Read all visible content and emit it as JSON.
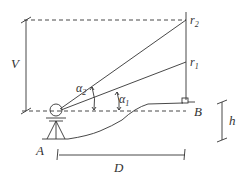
{
  "diagram": {
    "labels": {
      "V": "V",
      "alpha2": "α",
      "alpha2_sub": "2",
      "alpha1": "α",
      "alpha1_sub": "1",
      "r2": "r",
      "r2_sub": "2",
      "r1": "r",
      "r1_sub": "1",
      "A": "A",
      "B": "B",
      "h": "h",
      "D": "D"
    },
    "colors": {
      "line": "#333333",
      "background": "#ffffff"
    }
  }
}
